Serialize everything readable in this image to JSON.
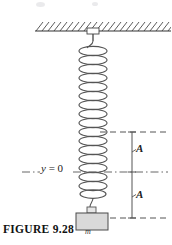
{
  "figure": {
    "caption": "FIGURE  9.28",
    "origin_label": {
      "variable": "y",
      "equals_value": " = 0"
    },
    "amplitude_upper_label": "A",
    "amplitude_lower_label": "A",
    "mass_label": "m",
    "icons": {
      "ceiling_hatch": "hatched-ceiling-icon",
      "spring": "coil-spring-icon",
      "mass_block": "mass-block-icon",
      "bracket_upper": "amplitude-bracket-icon",
      "bracket_lower": "amplitude-bracket-icon",
      "equilibrium_line": "dash-dot-line-icon",
      "upper_extreme_line": "dashed-line-icon",
      "lower_extreme_line": "dashed-line-icon",
      "hanger_rod": "hanger-rod-icon",
      "ceiling_anchor": "ceiling-anchor-icon"
    },
    "colors": {
      "ink": "#1a1a1a",
      "line": "#4a4a4a",
      "spring": "#555555",
      "mass_fill": "#d9d9d9",
      "background": "#ffffff"
    },
    "geometry": {
      "ceiling_y": 22,
      "upper_extreme_y": 132,
      "equilibrium_y": 172,
      "lower_extreme_y": 218,
      "spring_center_x": 93,
      "spring_top_y": 40,
      "spring_bottom_y": 206,
      "coil_count": 18
    }
  }
}
